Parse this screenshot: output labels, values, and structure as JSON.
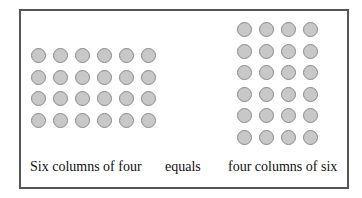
{
  "diagram": {
    "left_array": {
      "columns": 6,
      "rows": 4,
      "label": "Six columns of four"
    },
    "connector": {
      "label": "equals"
    },
    "right_array": {
      "columns": 4,
      "rows": 6,
      "label": "four columns of six"
    },
    "colors": {
      "dot_fill": "#c8c8c8",
      "dot_stroke": "#8a8a8a",
      "frame": "#555555"
    }
  }
}
